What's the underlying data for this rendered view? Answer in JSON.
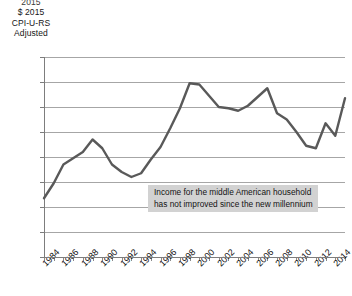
{
  "axis_title": {
    "clipped_top": "2015",
    "line1": "$ 2015",
    "line2": "CPI-U-RS",
    "line3": "Adjusted"
  },
  "annotation": {
    "line1": "Income for the middle American household",
    "line2": "has not improved since the new millennium"
  },
  "colors": {
    "line": "#595959",
    "gridline": "#a6a6a6",
    "axis": "#7d7d7d",
    "annotation_background": "#d2d2d2",
    "text": "#111111"
  },
  "chart_data": {
    "type": "line",
    "title": "",
    "xlabel": "",
    "ylabel": "$ 2015 CPI-U-RS Adjusted",
    "ylim": [
      44000,
      60000
    ],
    "ytick_labels": [
      "60000",
      "58000",
      "56000",
      "54000",
      "52000",
      "50000",
      "48000",
      "46000",
      "44000"
    ],
    "yticks": [
      60000,
      58000,
      56000,
      54000,
      52000,
      50000,
      48000,
      46000,
      44000
    ],
    "xlim": [
      1984,
      2015
    ],
    "xtick_labels": [
      "1984",
      "1986",
      "1988",
      "1990",
      "1992",
      "1994",
      "1996",
      "1998",
      "2000",
      "2002",
      "2004",
      "2006",
      "2008",
      "2010",
      "2012",
      "2014"
    ],
    "xticks": [
      1984,
      1986,
      1988,
      1990,
      1992,
      1994,
      1996,
      1998,
      2000,
      2002,
      2004,
      2006,
      2008,
      2010,
      2012,
      2014
    ],
    "grid": true,
    "legend": false,
    "x": [
      1984,
      1985,
      1986,
      1987,
      1988,
      1989,
      1990,
      1991,
      1992,
      1993,
      1994,
      1995,
      1996,
      1997,
      1998,
      1999,
      2000,
      2001,
      2002,
      2003,
      2004,
      2005,
      2006,
      2007,
      2008,
      2009,
      2010,
      2011,
      2012,
      2013,
      2014,
      2015
    ],
    "values": [
      48700,
      49900,
      51400,
      51900,
      52400,
      53400,
      52700,
      51400,
      50800,
      50400,
      50700,
      51800,
      52800,
      54300,
      55900,
      57900,
      57800,
      56900,
      56000,
      55900,
      55700,
      56100,
      56800,
      57500,
      55500,
      55000,
      54000,
      52900,
      52700,
      54700,
      53700,
      56700
    ],
    "series": [
      {
        "name": "Median household income",
        "values": [
          48700,
          49900,
          51400,
          51900,
          52400,
          53400,
          52700,
          51400,
          50800,
          50400,
          50700,
          51800,
          52800,
          54300,
          55900,
          57900,
          57800,
          56900,
          56000,
          55900,
          55700,
          56100,
          56800,
          57500,
          55500,
          55000,
          54000,
          52900,
          52700,
          54700,
          53700,
          56700
        ]
      }
    ]
  }
}
